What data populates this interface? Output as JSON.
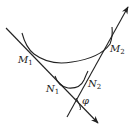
{
  "diagram": {
    "type": "geometry",
    "labels": {
      "M1": {
        "base": "M",
        "sub": "1"
      },
      "M2": {
        "base": "M",
        "sub": "2"
      },
      "N1": {
        "base": "N",
        "sub": "1"
      },
      "N2": {
        "base": "N",
        "sub": "2"
      },
      "angle": "φ"
    },
    "colors": {
      "stroke": "#222222",
      "background": "#ffffff"
    }
  }
}
